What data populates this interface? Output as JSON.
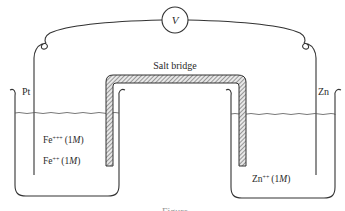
{
  "diagram": {
    "type": "electrochemical-cell",
    "voltmeter": {
      "symbol": "V"
    },
    "salt_bridge": {
      "label": "Salt bridge"
    },
    "left_electrode": {
      "label": "Pt"
    },
    "right_electrode": {
      "label": "Zn"
    },
    "left_solution": {
      "line1": {
        "ion": "Fe",
        "charge": "+++",
        "conc": "(1",
        "unit": "M",
        "close": ")"
      },
      "line2": {
        "ion": "Fe",
        "charge": "++",
        "conc": "(1",
        "unit": "M",
        "close": ")"
      }
    },
    "right_solution": {
      "line1": {
        "ion": "Zn",
        "charge": "++",
        "conc": "(1",
        "unit": "M",
        "close": ")"
      }
    },
    "caption": "Figure"
  },
  "colors": {
    "line": "#333333",
    "text": "#2a2a2a",
    "background": "#ffffff"
  }
}
